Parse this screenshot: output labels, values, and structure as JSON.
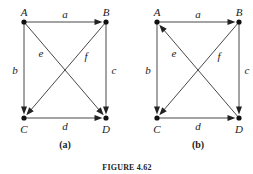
{
  "figure_caption": "FIGURE 4.62",
  "graphs": [
    {
      "id": "a",
      "caption": "(a)",
      "nodes": [
        {
          "id": "A",
          "label": "A"
        },
        {
          "id": "B",
          "label": "B"
        },
        {
          "id": "C",
          "label": "C"
        },
        {
          "id": "D",
          "label": "D"
        }
      ],
      "edges": [
        {
          "label": "a",
          "from": "A",
          "to": "B"
        },
        {
          "label": "b",
          "from": "A",
          "to": "C"
        },
        {
          "label": "c",
          "from": "B",
          "to": "D"
        },
        {
          "label": "d",
          "from": "C",
          "to": "D"
        },
        {
          "label": "e",
          "from": "A",
          "to": "D"
        },
        {
          "label": "f",
          "from": "B",
          "to": "C"
        }
      ]
    },
    {
      "id": "b",
      "caption": "(b)",
      "nodes": [
        {
          "id": "A",
          "label": "A"
        },
        {
          "id": "B",
          "label": "B"
        },
        {
          "id": "C",
          "label": "C"
        },
        {
          "id": "D",
          "label": "D"
        }
      ],
      "edges": [
        {
          "label": "a",
          "from": "A",
          "to": "B"
        },
        {
          "label": "b",
          "from": "A",
          "to": "C"
        },
        {
          "label": "c",
          "from": "B",
          "to": "D"
        },
        {
          "label": "d",
          "from": "C",
          "to": "D"
        },
        {
          "label": "e",
          "from": "D",
          "to": "A"
        },
        {
          "label": "f",
          "from": "B",
          "to": "C"
        }
      ]
    }
  ]
}
